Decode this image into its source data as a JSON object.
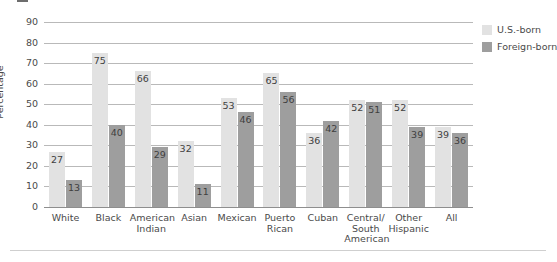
{
  "chart_data": {
    "type": "bar",
    "title": "",
    "xlabel": "",
    "ylabel": "Percentage",
    "ylim": [
      0,
      90
    ],
    "yticks": [
      0,
      10,
      20,
      30,
      40,
      50,
      60,
      70,
      80,
      90
    ],
    "grid": true,
    "legend_position": "right",
    "categories": [
      "White",
      "Black",
      "American Indian",
      "Asian",
      "Mexican",
      "Puerto Rican",
      "Cuban",
      "Central/ South American",
      "Other Hispanic",
      "All"
    ],
    "category_lines": [
      [
        "White"
      ],
      [
        "Black"
      ],
      [
        "American",
        "Indian"
      ],
      [
        "Asian"
      ],
      [
        "Mexican"
      ],
      [
        "Puerto",
        "Rican"
      ],
      [
        "Cuban"
      ],
      [
        "Central/",
        "South",
        "American"
      ],
      [
        "Other",
        "Hispanic"
      ],
      [
        "All"
      ]
    ],
    "series": [
      {
        "name": "U.S.-born",
        "color": "#e2e2e2",
        "values": [
          27,
          75,
          66,
          32,
          53,
          65,
          36,
          52,
          52,
          39
        ]
      },
      {
        "name": "Foreign-born",
        "color": "#9e9e9e",
        "values": [
          13,
          40,
          29,
          11,
          46,
          56,
          42,
          51,
          39,
          36
        ]
      }
    ]
  },
  "legend": {
    "items": [
      {
        "label": "U.S.-born"
      },
      {
        "label": "Foreign-born"
      }
    ]
  },
  "axis": {
    "ylabel": "Percentage"
  }
}
